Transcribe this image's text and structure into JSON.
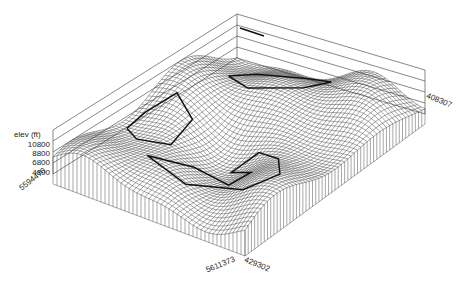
{
  "chart_data": {
    "type": "surface-wireframe-3d",
    "title": "",
    "zlabel": "elev (ft)",
    "z_ticks": [
      "10800",
      "8800",
      "6800",
      "4800"
    ],
    "zlim": [
      4800,
      10800
    ],
    "x_axis_corner_labels": {
      "left_corner": "5594470",
      "bottom_corner_left": "5611373",
      "bottom_corner_right": "429302",
      "right_corner": "408307"
    },
    "grid": true,
    "overlay": "dark traced boundary polylines on the surface",
    "legend": {
      "position": "top-center",
      "entries": [
        "(illegible line sample)"
      ]
    }
  },
  "labels": {
    "zlabel": "elev (ft)",
    "zticks": [
      "10800",
      "8800",
      "6800",
      "4800"
    ],
    "left": "5594470",
    "bottom_left": "5611373",
    "bottom_right": "429302",
    "right": "408307"
  },
  "colors": {
    "mesh": "#3a3a3a",
    "boundary": "#111111",
    "axis": "#555555",
    "background": "#ffffff"
  }
}
